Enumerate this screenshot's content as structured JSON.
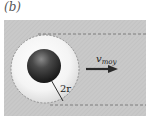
{
  "figure": {
    "panel_label": "(b)",
    "velocity_label": "v",
    "velocity_subscript": "moy",
    "radius_label": "2r"
  },
  "colors": {
    "band": "#c8c8c8",
    "dashed": "#6a6a6a",
    "halo_edge": "#e8e8e8",
    "sphere_dark": "#1e1e1e",
    "arrow": "#2a2a2a"
  }
}
